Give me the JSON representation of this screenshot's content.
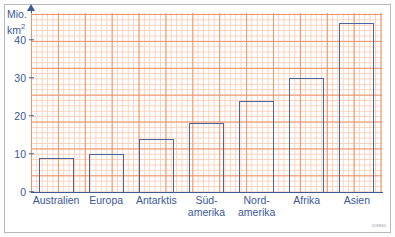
{
  "chart_data": {
    "type": "bar",
    "title": "",
    "subtitle": "",
    "xlabel": "",
    "ylabel": "Mio. km²",
    "ylabel_line1": "Mio.",
    "ylabel_line2": "km",
    "ylabel_exponent": "2",
    "categories": [
      "Australien",
      "Europa",
      "Antarktis",
      "Süd-\namerika",
      "Nord-\namerika",
      "Afrika",
      "Asien"
    ],
    "category_labels_flat": [
      "Australien",
      "Europa",
      "Antarktis",
      "Südamerika",
      "Nordamerika",
      "Afrika",
      "Asien"
    ],
    "values": [
      9,
      10,
      14,
      18,
      24,
      30,
      44.5
    ],
    "ylim": [
      0,
      47
    ],
    "ytick_labels": [
      "0",
      "10",
      "20",
      "30",
      "40"
    ],
    "ytick_values": [
      0,
      10,
      20,
      30,
      40
    ],
    "grid": "graph-paper: fine 1-unit grid with bold every 5 units",
    "legend": "none",
    "bar_style": "outlined, unfilled",
    "colors": {
      "bar_stroke": "#4a669e",
      "axis": "#3c5a96",
      "text": "#3a5896",
      "grid_fine": "#f7c9ae",
      "grid_coarse": "#f0936a",
      "background": "#ffffff",
      "frame": "#b9b9bb"
    }
  },
  "footer": {
    "code": "118860"
  }
}
